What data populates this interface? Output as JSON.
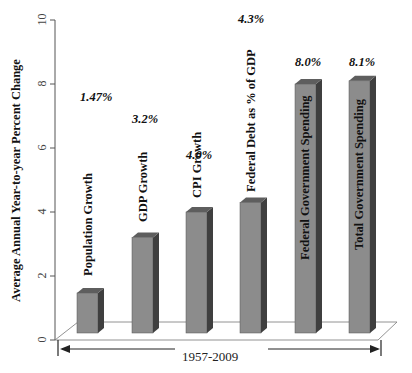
{
  "chart_data": {
    "type": "bar",
    "title": "",
    "xlabel": "1957-2009",
    "ylabel": "Average Annual Year-to-year Percent Change",
    "ylim": [
      0,
      10
    ],
    "yticks": [
      0,
      2,
      4,
      6,
      8,
      10
    ],
    "grid": false,
    "legend": null,
    "style": "3d-column",
    "categories": [
      "Population Growth",
      "GDP Growth",
      "CPI Growth",
      "Federal Debt as % of GDP",
      "Federal Government Spending",
      "Total Government Spending"
    ],
    "values": [
      1.47,
      3.2,
      4.0,
      4.3,
      8.0,
      8.1
    ],
    "value_labels": [
      "1.47%",
      "3.2%",
      "4.0%",
      "4.3%",
      "8.0%",
      "8.1%"
    ],
    "colors": {
      "bar_front": "#8c8c8c",
      "bar_side": "#3f3f3f",
      "bar_top": "#5e5e5e",
      "axis": "#555555"
    }
  },
  "axis": {
    "y_title": "Average Annual Year-to-year Percent Change",
    "y_ticks": [
      "0",
      "2",
      "4",
      "6",
      "8",
      "10"
    ],
    "x_range_label": "1957-2009"
  }
}
